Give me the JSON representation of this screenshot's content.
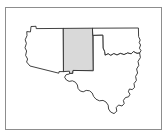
{
  "figure": {
    "title": "Map of the southwestern United States",
    "frame_color": "#8d8d8d",
    "background_color": "#ffffff",
    "outline_color": "#2b2b2b",
    "highlight_color": "#d9d9d9",
    "plain_fill_color": "#ffffff"
  },
  "map": {
    "region_label": "United States Southwest",
    "highlighted_state": "New Mexico",
    "states": [
      {
        "id": "arizona",
        "name": "Arizona",
        "highlighted": false,
        "fill": "#ffffff",
        "path": "M 30.5 31.5 L 31.0 26.5 L 36.0 26.3 L 36.2 28.6 L 63.5 28.4 L 63.8 71.6 L 59.0 71.6 L 58.8 73.2 L 30.0 66.0 L 26.6 62.0 L 27.6 59.0 L 25.6 55.4 L 26.6 51.0 L 25.0 47.8 L 26.4 43.4 L 25.2 39.8 L 27.0 35.6 L 26.8 32.0 Z"
      },
      {
        "id": "new-mexico",
        "name": "New Mexico",
        "highlighted": true,
        "fill": "#d9d9d9",
        "path": "M 63.5 28.4 L 92.8 28.2 L 93.3 70.4 L 73.0 70.8 L 72.8 73.4 L 69.6 73.4 L 69.4 71.2 L 63.8 71.6 Z"
      },
      {
        "id": "oklahoma",
        "name": "Oklahoma",
        "highlighted": false,
        "fill": "#ffffff",
        "path": "M 92.8 28.2 L 138.4 28.0 L 138.6 36.6 L 140.2 40.0 L 139.2 42.6 L 140.6 45.0 L 139.4 48.2 L 141.0 50.6 L 139.6 53.0 L 137.0 53.4 L 133.4 51.6 L 131.2 53.8 L 127.6 53.0 L 124.0 54.6 L 120.4 53.4 L 117.0 55.0 L 113.8 53.6 L 110.8 55.4 L 108.2 53.8 L 105.0 55.2 L 104.6 51.6 L 103.0 48.0 L 102.8 35.2 L 93.2 35.4 Z"
      },
      {
        "id": "texas",
        "name": "Texas",
        "highlighted": false,
        "fill": "#ffffff",
        "path": "M 93.3 70.4 L 93.2 35.4 L 102.8 35.2 L 103.0 48.0 L 104.6 51.6 L 105.0 55.2 L 108.2 53.8 L 110.8 55.4 L 113.8 53.6 L 117.0 55.0 L 120.4 53.4 L 124.0 54.6 L 127.6 53.0 L 131.2 53.8 L 133.4 51.6 L 137.0 53.4 L 139.6 53.0 L 140.4 57.6 L 138.0 61.4 L 138.8 65.4 L 136.6 69.0 L 137.6 73.0 L 135.6 76.4 L 136.4 80.4 L 134.0 83.6 L 134.6 87.4 L 132.2 89.6 L 129.4 89.0 L 128.4 91.8 L 130.0 94.2 L 128.6 96.8 L 125.4 97.6 L 123.4 100.4 L 124.2 103.6 L 122.0 106.0 L 118.6 105.0 L 116.2 107.6 L 116.8 111.2 L 114.0 113.6 L 110.6 112.0 L 108.6 109.0 L 108.2 105.2 L 106.0 102.0 L 103.0 100.4 L 99.4 100.8 L 96.0 99.2 L 93.6 96.4 L 92.2 93.0 L 89.6 90.8 L 86.2 90.4 L 83.2 91.8 L 80.2 91.0 L 78.0 88.4 L 77.4 85.0 L 75.4 82.2 L 72.4 80.8 L 69.2 81.4 L 66.4 80.0 L 64.6 77.2 L 66.2 74.6 L 69.4 74.0 L 69.6 73.4 L 72.8 73.4 L 73.0 70.8 Z"
      }
    ],
    "borders": [
      {
        "id": "arizona-california-border",
        "name": "Arizona western border"
      },
      {
        "id": "four-corners-notch",
        "name": "Arizona northwest notch"
      },
      {
        "id": "texas-gulf-coast",
        "name": "Texas Gulf Coast"
      },
      {
        "id": "texas-panhandle",
        "name": "Texas Panhandle"
      },
      {
        "id": "oklahoma-panhandle",
        "name": "Oklahoma Panhandle"
      }
    ]
  }
}
